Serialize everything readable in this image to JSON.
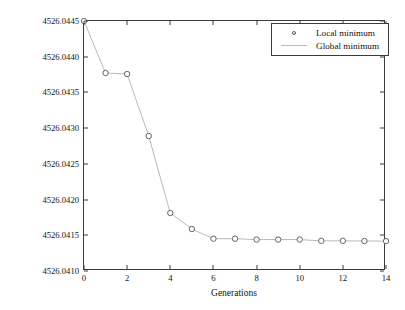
{
  "chart_data": {
    "type": "line",
    "title": "",
    "xlabel": "Generations",
    "ylabel": "Augmented objective function (crore INR/year)",
    "xlim": [
      0,
      14
    ],
    "ylim": [
      4526.041,
      4526.0445
    ],
    "grid": false,
    "legend_position": "top-right",
    "xticks": [
      0,
      2,
      4,
      6,
      8,
      10,
      12,
      14
    ],
    "xtick_labels": [
      "0",
      "2",
      "4",
      "6",
      "8",
      "10",
      "12",
      "14"
    ],
    "yticks": [
      4526.041,
      4526.0415,
      4526.042,
      4526.0425,
      4526.043,
      4526.0435,
      4526.044,
      4526.0445
    ],
    "ytick_labels": [
      "4526.0410",
      "4526.0415",
      "4526.0420",
      "4526.0425",
      "4526.0430",
      "4526.0435",
      "4526.0440",
      "4526.0445"
    ],
    "x": [
      0,
      1,
      2,
      3,
      4,
      5,
      6,
      7,
      8,
      9,
      10,
      11,
      12,
      13,
      14
    ],
    "series": [
      {
        "name": "Local minimum",
        "marker": "circle",
        "values": [
          4526.0445,
          4526.043772,
          4526.043758,
          4526.04289,
          4526.041812,
          4526.041588,
          4526.041452,
          4526.041452,
          4526.04144,
          4526.04144,
          4526.04144,
          4526.041422,
          4526.041422,
          4526.04142,
          4526.041418
        ]
      },
      {
        "name": "Global minimum",
        "marker": "line",
        "values": [
          4526.0445,
          4526.043772,
          4526.043758,
          4526.04289,
          4526.041812,
          4526.041588,
          4526.041452,
          4526.041452,
          4526.04144,
          4526.04144,
          4526.04144,
          4526.041422,
          4526.041422,
          4526.04142,
          4526.041418
        ]
      }
    ],
    "colors": {
      "line": "#b9b9b9",
      "marker_edge": "#555555",
      "marker_face": "#ffffff",
      "axis": "#3a3a3a",
      "background": "#ffffff"
    }
  },
  "legend": {
    "entries": [
      {
        "label": "Local minimum"
      },
      {
        "label": "Global minimum"
      }
    ]
  }
}
